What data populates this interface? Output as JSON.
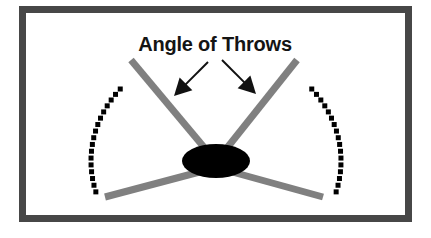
{
  "figure": {
    "title": "Angle of Throws",
    "background_color": "#ffffff",
    "frame": {
      "name": "outer-border",
      "color": "#474747",
      "x": 19,
      "y": 6,
      "width": 393,
      "height": 216,
      "stroke_width": 7
    },
    "label": {
      "text": "Angle of Throws",
      "center_x": 215,
      "baseline_y": 51,
      "color": "#141414",
      "font_size": 20,
      "bold": true
    },
    "hub": {
      "name": "central-ellipse",
      "shape": "ellipse",
      "center_x": 216,
      "center_y": 161,
      "radius_x": 34,
      "radius_y": 17,
      "color": "#000000"
    },
    "throw_lines": {
      "color": "#808080",
      "stroke_width": 7,
      "lines": [
        {
          "name": "throw-line-upper-left",
          "x1": 213,
          "y1": 158,
          "x2": 131,
          "y2": 60
        },
        {
          "name": "throw-line-upper-right",
          "x1": 219,
          "y1": 158,
          "x2": 297,
          "y2": 60
        },
        {
          "name": "throw-line-lower-left",
          "x1": 207,
          "y1": 170,
          "x2": 105,
          "y2": 197
        },
        {
          "name": "throw-line-lower-right",
          "x1": 225,
          "y1": 170,
          "x2": 323,
          "y2": 197
        }
      ]
    },
    "dotted_arcs": {
      "color": "#000000",
      "dot_size": 5,
      "center_x": 216,
      "center_y": 161,
      "radius_x": 125,
      "radius_y": 112,
      "left_arc": {
        "name": "dotted-arc-left",
        "start_angle_deg": 140,
        "end_angle_deg": 196,
        "dot_count": 17
      },
      "right_arc": {
        "name": "dotted-arc-right",
        "start_angle_deg": 40,
        "end_angle_deg": -16,
        "dot_count": 17
      }
    },
    "arrows": {
      "color": "#111111",
      "stroke_width": 2,
      "items": [
        {
          "name": "arrow-left",
          "direction": "down-left",
          "tail_x": 208,
          "tail_y": 62,
          "tip_x": 174,
          "tip_y": 96
        },
        {
          "name": "arrow-right",
          "direction": "down-right",
          "tail_x": 222,
          "tail_y": 60,
          "tip_x": 256,
          "tip_y": 94
        }
      ]
    }
  }
}
